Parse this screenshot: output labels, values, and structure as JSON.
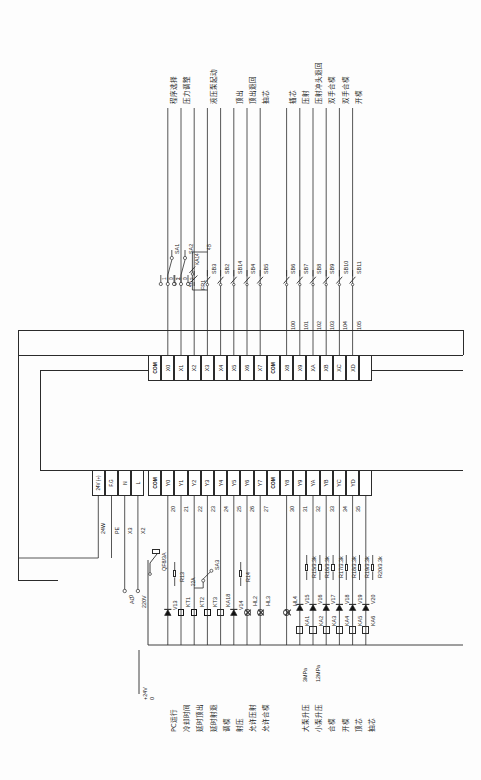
{
  "diagram": {
    "type": "plc-wiring-schematic",
    "power": {
      "supply_label": "+24V",
      "zero_label": "0",
      "breaker": "QF8/3A",
      "ac_source": "AC",
      "ac_voltage": "220V",
      "ac_zero": "0",
      "wire_24w": "24W",
      "wire_pe": "PE",
      "wire_x3": "X3",
      "wire_x2": "X2"
    },
    "psu_terminals": [
      {
        "name": "24V (+)",
        "wire": "24W"
      },
      {
        "name": "F.G",
        "wire": "PE"
      },
      {
        "name": "N",
        "wire": "X3"
      },
      {
        "name": "L",
        "wire": "X2"
      }
    ],
    "input_terminals": [
      "COM",
      "X0",
      "X1",
      "X2",
      "X3",
      "X4",
      "X5",
      "X6",
      "X7",
      "COM",
      "X8",
      "X9",
      "XA",
      "XB",
      "XC",
      "XD",
      ""
    ],
    "output_terminals": [
      "COM",
      "Y0",
      "Y1",
      "Y2",
      "Y3",
      "Y4",
      "Y5",
      "Y6",
      "Y7",
      "COM",
      "Y8",
      "Y9",
      "YA",
      "YB",
      "YC",
      "YD",
      ""
    ],
    "output_wire_numbers": [
      "",
      "20",
      "21",
      "22",
      "23",
      "24",
      "25",
      "26",
      "27",
      "",
      "30",
      "31",
      "32",
      "33",
      "34",
      "35",
      ""
    ],
    "input_wire_numbers": [
      "100",
      "101",
      "102",
      "103",
      "104",
      "105"
    ],
    "input_circuits": [
      {
        "terminal": "X0",
        "device": "SA1",
        "function": "程序选择",
        "switch_positions": [
          "1",
          "0",
          "2"
        ],
        "type": "selector"
      },
      {
        "terminal": "X1",
        "device": "SA2",
        "function": "压力调整",
        "switch_positions": [
          "1",
          "0",
          "2"
        ],
        "type": "selector"
      },
      {
        "terminal": "X2",
        "device": "FR1",
        "function": "",
        "type": "thermal-overload"
      },
      {
        "terminal": "X3",
        "device": "SB3",
        "function": "液压泵起动",
        "aux": "KA14",
        "wire_a": "4A",
        "wire_b": "4B",
        "type": "button-latch"
      },
      {
        "terminal": "X4",
        "device": "SB2",
        "function": "",
        "type": "button"
      },
      {
        "terminal": "X5",
        "device": "SB14",
        "function": "顶出",
        "type": "button"
      },
      {
        "terminal": "X6",
        "device": "SB4",
        "function": "顶出退回",
        "type": "button"
      },
      {
        "terminal": "X7",
        "device": "SB5",
        "function": "抽芯",
        "type": "button"
      },
      {
        "terminal": "X8",
        "device": "SB6",
        "function": "插芯",
        "type": "button"
      },
      {
        "terminal": "X9",
        "device": "SB7",
        "function": "压射",
        "type": "button"
      },
      {
        "terminal": "XA",
        "device": "SB8",
        "function": "压射冲头退回",
        "type": "button"
      },
      {
        "terminal": "XB",
        "device": "SB9",
        "function": "双手合模",
        "type": "button"
      },
      {
        "terminal": "XC",
        "device": "SB10",
        "function": "双手合模",
        "type": "button"
      },
      {
        "terminal": "XD",
        "device": "SB11",
        "function": "开模",
        "type": "button"
      }
    ],
    "output_circuits": [
      {
        "terminal": "Y0",
        "wire": "20",
        "device": "V13",
        "resistor": "R13",
        "load": "",
        "function": "PC运行",
        "type": "diode-res"
      },
      {
        "terminal": "Y1",
        "wire": "21",
        "device": "KT1",
        "load": "KT1",
        "function": "冷却时间",
        "type": "timer"
      },
      {
        "terminal": "Y2",
        "wire": "22",
        "device": "KT2",
        "load": "KT2",
        "function": "延时顶出",
        "aux": "SA3",
        "wire_a": "22A",
        "type": "timer"
      },
      {
        "terminal": "Y3",
        "wire": "23",
        "device": "KT3",
        "load": "KT3",
        "function": "延时射退",
        "type": "timer"
      },
      {
        "terminal": "Y4",
        "wire": "24",
        "device": "KA18",
        "load": "KA18",
        "function": "调模",
        "type": "relay"
      },
      {
        "terminal": "Y5",
        "wire": "25",
        "device": "V14",
        "resistor": "R14",
        "load": "",
        "function": "射压",
        "type": "diode-res"
      },
      {
        "terminal": "Y6",
        "wire": "26",
        "device": "HL2",
        "load": "HL2",
        "function": "允许压射",
        "type": "lamp"
      },
      {
        "terminal": "Y7",
        "wire": "27",
        "device": "HL3",
        "load": "HL3",
        "function": "允许合模",
        "type": "lamp"
      },
      {
        "terminal": "Y8",
        "wire": "30",
        "device": "HL4",
        "load": "HL4",
        "function": "",
        "type": "lamp"
      },
      {
        "terminal": "Y9",
        "wire": "31",
        "device": "V15",
        "resistor": "R15/3.3k",
        "load": "KA1",
        "function": "大泵升压",
        "pressure": "3MPa",
        "type": "relay-diode"
      },
      {
        "terminal": "YA",
        "wire": "32",
        "device": "V16",
        "resistor": "R16/3.3k",
        "load": "KA2",
        "function": "小泵升压",
        "pressure": "12MPa",
        "type": "relay-diode"
      },
      {
        "terminal": "YB",
        "wire": "33",
        "device": "V17",
        "resistor": "R17/3.3k",
        "load": "KA3",
        "function": "合模",
        "type": "relay-diode"
      },
      {
        "terminal": "YC",
        "wire": "34",
        "device": "V18",
        "resistor": "R18/3.3k",
        "load": "KA4",
        "function": "开模",
        "type": "relay-diode"
      },
      {
        "terminal": "YD",
        "wire": "35",
        "device": "V19",
        "resistor": "R19/3.3k",
        "load": "KA5",
        "function": "顶芯",
        "type": "relay-diode"
      },
      {
        "terminal": "",
        "wire": "",
        "device": "V20",
        "resistor": "R20/3.3k",
        "load": "KA6",
        "function": "抽芯",
        "type": "relay-diode"
      }
    ],
    "top_functions": [
      "程序选择",
      "压力调整",
      "液压泵起动",
      "顶出",
      "顶出退回",
      "抽芯",
      "插芯",
      "压射",
      "压射冲头退回",
      "双手合模",
      "双手合模",
      "开模"
    ],
    "bottom_functions": [
      "PC运行",
      "冷却时间",
      "延时顶出",
      "延时射退",
      "调模",
      "射压",
      "允许压射",
      "允许合模",
      "大泵升压",
      "小泵升压",
      "合模",
      "开模",
      "顶芯",
      "抽芯"
    ],
    "pressure_labels": [
      "3MPa",
      "12MPa"
    ],
    "colors": {
      "line": "#2b2b2b",
      "background": "#fdfdfd",
      "text": "#1b1b1b"
    }
  }
}
